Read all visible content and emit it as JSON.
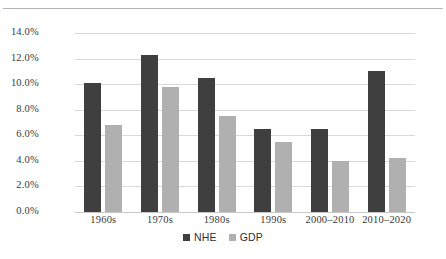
{
  "chart_data": {
    "type": "bar",
    "title": "",
    "xlabel": "",
    "ylabel": "",
    "categories": [
      "1960s",
      "1970s",
      "1980s",
      "1990s",
      "2000–2010",
      "2010–2020"
    ],
    "series": [
      {
        "name": "NHE",
        "color": "#3f3f3f",
        "values": [
          10.1,
          12.3,
          10.5,
          6.5,
          6.5,
          11.0
        ]
      },
      {
        "name": "GDP",
        "color": "#b0b0b0",
        "values": [
          6.8,
          9.8,
          7.5,
          5.5,
          4.0,
          4.2
        ]
      }
    ],
    "ylim": [
      0.0,
      14.0
    ],
    "ytick_values": [
      14.0,
      12.0,
      10.0,
      8.0,
      6.0,
      4.0,
      2.0,
      0.0
    ],
    "ytick_labels": [
      "14.0%",
      "12.0%",
      "10.0%",
      "8.0%",
      "6.0%",
      "4.0%",
      "2.0%",
      "0.0%"
    ],
    "grid": true,
    "grid_axis": "y",
    "legend_position": "bottom-center",
    "legend": [
      "NHE",
      "GDP"
    ]
  },
  "colors": {
    "background": "#ffffff",
    "gridline": "#d9d9d9",
    "axis_text": "#3a3a3a",
    "top_rule": "#b3b3b3",
    "nhe": "#3f3f3f",
    "gdp": "#b0b0b0"
  }
}
